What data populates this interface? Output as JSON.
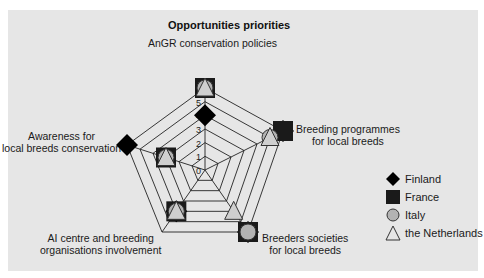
{
  "chart_data": {
    "type": "radar",
    "title": "Opportunities priorities",
    "axes": [
      "AnGR conservation policies",
      "Breeding programmes for local breeds",
      "Breeders  societies for local breeds",
      "AI centre and breeding organisations involvement",
      "Awareness for local breeds conservation"
    ],
    "ticks": [
      "0",
      "1",
      "2",
      "3",
      "4",
      "5",
      "6"
    ],
    "range": [
      0,
      6
    ],
    "series": [
      {
        "name": "Finland",
        "marker": "diamond",
        "color": "#000000",
        "values": [
          4,
          6,
          6,
          4,
          6
        ]
      },
      {
        "name": "France",
        "marker": "square",
        "color": "#1a1a1a",
        "values": [
          6,
          6,
          6,
          4,
          3
        ]
      },
      {
        "name": "Italy",
        "marker": "circle",
        "color": "#b3b3b3",
        "values": [
          6,
          5,
          6,
          4,
          3
        ]
      },
      {
        "name": "the Netherlands",
        "marker": "triangle",
        "color": "#cccccc",
        "values": [
          6,
          5,
          4,
          4,
          3
        ]
      }
    ],
    "legend_position": "right"
  },
  "labels": {
    "title": "Opportunities priorities",
    "axis_top": "AnGR conservation policies",
    "axis_right_1": "Breeding programmes",
    "axis_right_2": "for local breeds",
    "axis_bottom_right_1": "Breeders  societies",
    "axis_bottom_right_2": "for local breeds",
    "axis_bottom_left_1": "AI centre and breeding",
    "axis_bottom_left_2": "organisations involvement",
    "axis_left_1": "Awareness for",
    "axis_left_2": "local breeds conservation"
  },
  "legend": [
    {
      "label": "Finland"
    },
    {
      "label": "France"
    },
    {
      "label": "Italy"
    },
    {
      "label": "the Netherlands"
    }
  ]
}
